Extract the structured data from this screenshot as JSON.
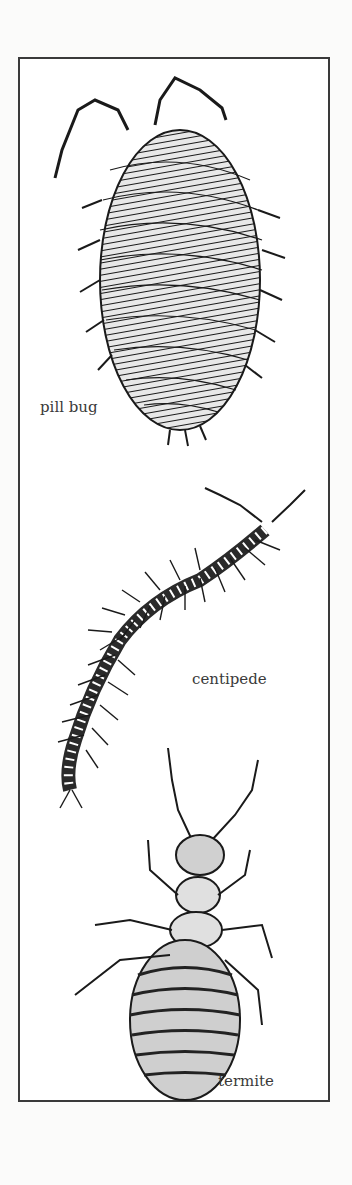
{
  "illustration": {
    "labels": {
      "pill_bug": "pill bug",
      "centipede": "centipede",
      "termite": "termite"
    },
    "colors": {
      "ink": "#1a1a1a",
      "paper": "#ffffff",
      "border": "#3a3a3a"
    }
  }
}
